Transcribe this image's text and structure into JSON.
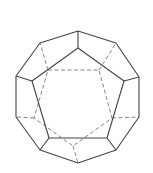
{
  "diagram": {
    "view": "face-on wireframe with hidden edges dashed",
    "colors": {
      "background": "#ffffff",
      "visible_edge": "#444444",
      "hidden_edge": "#777777"
    },
    "outer_decagon": [
      [
        78,
        31
      ],
      [
        116,
        43
      ],
      [
        139,
        77
      ],
      [
        139,
        117
      ],
      [
        116,
        150
      ],
      [
        78,
        163
      ],
      [
        40,
        150
      ],
      [
        16,
        117
      ],
      [
        16,
        76
      ],
      [
        40,
        43
      ]
    ],
    "front_pentagon": [
      [
        78,
        48
      ],
      [
        124,
        81
      ],
      [
        107,
        138
      ],
      [
        49,
        138
      ],
      [
        32,
        81
      ]
    ],
    "front_connectors": [
      [
        [
          78,
          31
        ],
        [
          78,
          48
        ]
      ],
      [
        [
          139,
          77
        ],
        [
          124,
          81
        ]
      ],
      [
        [
          116,
          150
        ],
        [
          107,
          138
        ]
      ],
      [
        [
          40,
          150
        ],
        [
          49,
          138
        ]
      ],
      [
        [
          16,
          76
        ],
        [
          32,
          81
        ]
      ]
    ],
    "back_pentagon": [
      [
        48,
        70
      ],
      [
        99,
        70
      ],
      [
        112,
        118
      ],
      [
        73,
        146
      ],
      [
        34,
        118
      ]
    ],
    "back_connectors": [
      [
        [
          48,
          70
        ],
        [
          40,
          43
        ]
      ],
      [
        [
          99,
          70
        ],
        [
          116,
          43
        ]
      ],
      [
        [
          112,
          118
        ],
        [
          139,
          117
        ]
      ],
      [
        [
          73,
          146
        ],
        [
          78,
          163
        ]
      ],
      [
        [
          34,
          118
        ],
        [
          16,
          117
        ]
      ]
    ]
  }
}
